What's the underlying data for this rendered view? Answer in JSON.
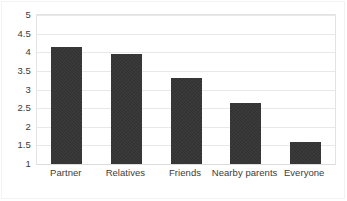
{
  "chart_data": {
    "type": "bar",
    "title": "",
    "subtitle": "",
    "xlabel": "",
    "ylabel": "",
    "categories": [
      "Partner",
      "Relatives",
      "Friends",
      "Nearby parents",
      "Everyone"
    ],
    "values": [
      4.15,
      3.95,
      3.3,
      2.65,
      1.6
    ],
    "ylim": [
      1,
      5
    ],
    "ytick_labels": [
      "5",
      "4.5",
      "4",
      "3.5",
      "3",
      "2.5",
      "2",
      "1.5",
      "1"
    ],
    "ytick_values": [
      5,
      4.5,
      4,
      3.5,
      3,
      2.5,
      2,
      1.5,
      1
    ],
    "grid": true,
    "grid_axis": "y",
    "legend": false,
    "legend_position": "none",
    "series": [
      {
        "name": "",
        "values": [
          4.15,
          3.95,
          3.3,
          2.65,
          1.6
        ]
      }
    ],
    "colors": {
      "bar": "#333333",
      "gridline": "#e8e8e8",
      "plot_border": "#e3e3e3",
      "text": "#3b3b3b",
      "background": "#ffffff"
    }
  }
}
